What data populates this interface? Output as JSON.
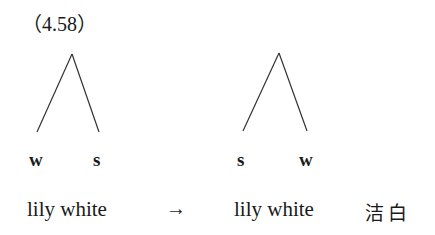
{
  "example_number": "（4.58）",
  "left_tree": {
    "labels": [
      "w",
      "s"
    ],
    "phrase": "lily white"
  },
  "arrow": "→",
  "right_tree": {
    "labels": [
      "s",
      "w"
    ],
    "phrase": "lily white",
    "gloss": "洁白"
  }
}
